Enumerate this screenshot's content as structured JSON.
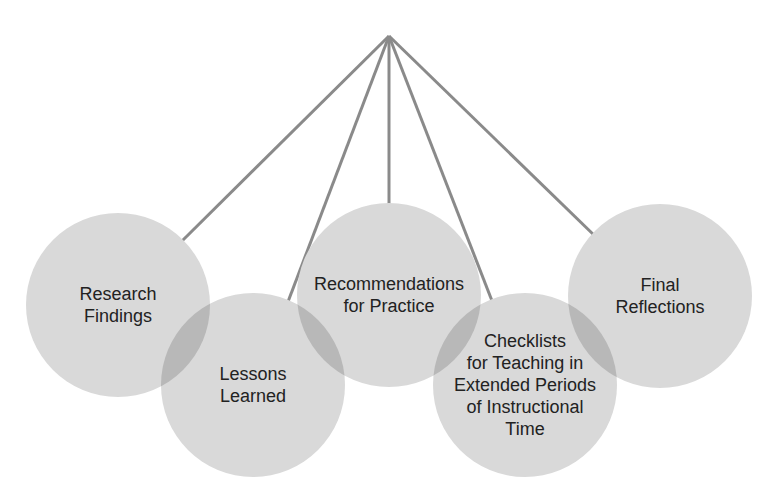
{
  "diagram": {
    "apex": {
      "x": 389,
      "y": 36
    },
    "line_color": "#8a8a8a",
    "circle_fill": "#d9d9d9",
    "overlap_fill": "#b8b8b8",
    "nodes": [
      {
        "id": "research-findings",
        "label": "Research\nFindings",
        "cx": 118,
        "cy": 305,
        "r": 92,
        "line_to": {
          "x": 182,
          "y": 241
        }
      },
      {
        "id": "lessons-learned",
        "label": "Lessons\nLearned",
        "cx": 253,
        "cy": 385,
        "r": 92,
        "line_to": {
          "x": 286,
          "y": 307
        }
      },
      {
        "id": "recommendations-for-practice",
        "label": "Recommendations\nfor Practice",
        "cx": 389,
        "cy": 295,
        "r": 92,
        "line_to": {
          "x": 389,
          "y": 214
        }
      },
      {
        "id": "checklists",
        "label": "Checklists\nfor Teaching in\nExtended Periods\nof Instructional\nTime",
        "cx": 525,
        "cy": 385,
        "r": 92,
        "line_to": {
          "x": 494,
          "y": 306
        }
      },
      {
        "id": "final-reflections",
        "label": "Final\nReflections",
        "cx": 660,
        "cy": 296,
        "r": 92,
        "line_to": {
          "x": 597,
          "y": 238
        }
      }
    ]
  }
}
